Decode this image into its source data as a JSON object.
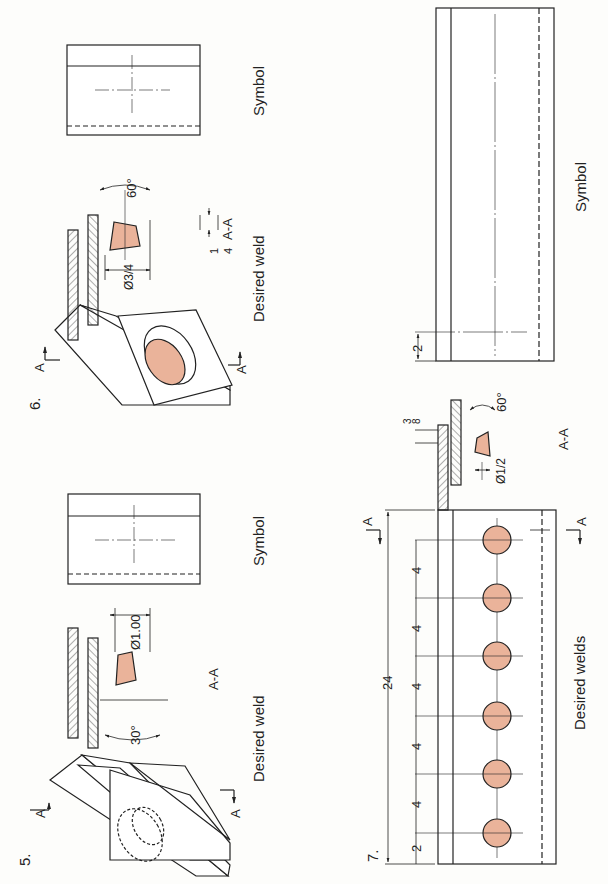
{
  "colors": {
    "line": "#222222",
    "weld_fill": "#eab39a",
    "paper": "#fdfdfb"
  },
  "problem5": {
    "number": "5.",
    "section_label_top": "A",
    "section_label_bottom": "A",
    "section_view_label": "A-A",
    "diameter": "Ø1.00",
    "angle": "30°",
    "caption_weld": "Desired weld",
    "caption_symbol": "Symbol"
  },
  "problem6": {
    "number": "6.",
    "section_label_top": "A",
    "section_label_bottom": "A",
    "section_view_label": "A-A",
    "diameter": "Ø3/4",
    "diameter_num": "3",
    "diameter_den": "4",
    "depth_num": "1",
    "depth_den": "4",
    "angle": "60°",
    "caption_weld": "Desired weld",
    "caption_symbol": "Symbol"
  },
  "problem7": {
    "number": "7.",
    "section_label_left": "A",
    "section_label_right": "A",
    "section_view_label": "A-A",
    "diameter": "Ø1/2",
    "depth_num": "3",
    "depth_den": "8",
    "angle": "60°",
    "overall_length": "24",
    "first_offset": "2",
    "spacings": [
      "4",
      "4",
      "4",
      "4",
      "4"
    ],
    "weld_count": 6,
    "symbol_offset": "2",
    "caption_weld": "Desired welds",
    "caption_symbol": "Symbol"
  }
}
